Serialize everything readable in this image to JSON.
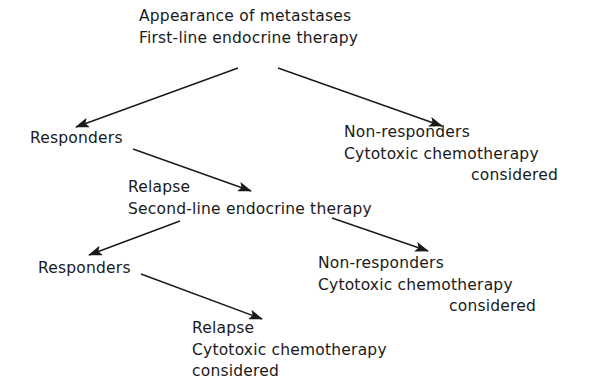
{
  "diagram": {
    "type": "flowchart",
    "root": {
      "line1": "Appearance of metastases",
      "line2": "First-line endocrine therapy"
    },
    "level1_responders": {
      "label": "Responders"
    },
    "level1_nonresponders": {
      "line1": "Non-responders",
      "line2": "Cytotoxic chemotherapy",
      "line3": "considered"
    },
    "level2_relapse": {
      "line1": "Relapse",
      "line2": "Second-line endocrine therapy"
    },
    "level2_responders": {
      "label": "Responders"
    },
    "level2_nonresponders": {
      "line1": "Non-responders",
      "line2": "Cytotoxic chemotherapy",
      "line3": "considered"
    },
    "level3_relapse": {
      "line1": "Relapse",
      "line2": "Cytotoxic chemotherapy",
      "line3": "considered"
    },
    "edges": [
      {
        "from": "root",
        "to": "level1_responders"
      },
      {
        "from": "root",
        "to": "level1_nonresponders"
      },
      {
        "from": "level1_responders",
        "to": "level2_relapse"
      },
      {
        "from": "level2_relapse",
        "to": "level2_responders"
      },
      {
        "from": "level2_relapse",
        "to": "level2_nonresponders"
      },
      {
        "from": "level2_responders",
        "to": "level3_relapse"
      }
    ],
    "colors": {
      "ink": "#1a1a1a",
      "background": "#ffffff"
    }
  }
}
